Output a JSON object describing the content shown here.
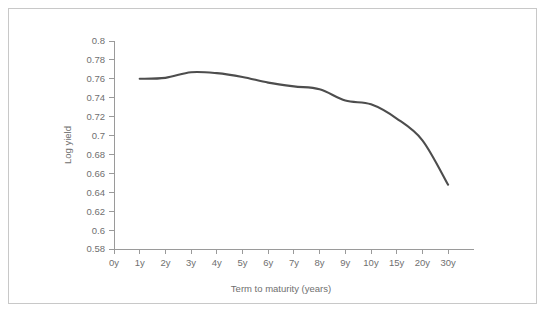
{
  "chart_data": {
    "type": "line",
    "title": "",
    "xlabel": "Term to maturity (years)",
    "ylabel": "Log yield",
    "categories": [
      "0y",
      "1y",
      "2y",
      "3y",
      "4y",
      "5y",
      "6y",
      "7y",
      "8y",
      "9y",
      "10y",
      "15y",
      "20y",
      "30y"
    ],
    "x_tick_labels": [
      "0y",
      "1y",
      "2y",
      "3y",
      "4y",
      "5y",
      "6y",
      "7y",
      "8y",
      "9y",
      "10y",
      "15y",
      "20y",
      "30y"
    ],
    "y_tick_labels": [
      "0.58",
      "0.6",
      "0.62",
      "0.64",
      "0.66",
      "0.68",
      "0.7",
      "0.72",
      "0.74",
      "0.76",
      "0.78",
      "0.8"
    ],
    "y_tick_values": [
      0.58,
      0.6,
      0.62,
      0.64,
      0.66,
      0.68,
      0.7,
      0.72,
      0.74,
      0.76,
      0.78,
      0.8
    ],
    "ylim": [
      0.58,
      0.8
    ],
    "grid": false,
    "legend": null,
    "series": [
      {
        "name": "Log yield curve",
        "x": [
          "1y",
          "2y",
          "3y",
          "4y",
          "5y",
          "6y",
          "7y",
          "8y",
          "9y",
          "10y",
          "15y",
          "20y",
          "30y"
        ],
        "values": [
          0.76,
          0.761,
          0.767,
          0.766,
          0.762,
          0.756,
          0.752,
          0.749,
          0.737,
          0.733,
          0.718,
          0.695,
          0.648
        ],
        "color": "#4d4d4d"
      }
    ],
    "colors": {
      "curve": "#4d4d4d",
      "axis": "#9a9a9a",
      "text": "#6f6f6f",
      "frame": "#c8c8c8",
      "background": "#ffffff"
    }
  }
}
